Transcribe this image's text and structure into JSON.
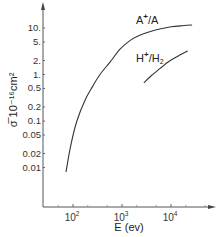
{
  "chart_data": {
    "type": "line",
    "title": "",
    "xlabel": "E (ev)",
    "ylabel": "σ̅ 10⁻¹⁶cm²",
    "xscale": "log",
    "yscale": "log",
    "xlim": [
      20,
      100000
    ],
    "ylim": [
      0.0025,
      30
    ],
    "grid": false,
    "legend": "inline",
    "x_ticks": [
      {
        "value": 100,
        "label_base": "10",
        "label_exp": "2"
      },
      {
        "value": 1000,
        "label_base": "10",
        "label_exp": "3"
      },
      {
        "value": 10000,
        "label_base": "10",
        "label_exp": "4"
      }
    ],
    "x_minor_ticks": [
      50,
      200,
      500,
      2000,
      5000,
      20000,
      50000
    ],
    "y_ticks": [
      {
        "value": 10,
        "label": "10."
      },
      {
        "value": 5,
        "label": "5."
      },
      {
        "value": 2,
        "label": "2."
      },
      {
        "value": 1,
        "label": "1."
      },
      {
        "value": 0.5,
        "label": "0.5"
      },
      {
        "value": 0.2,
        "label": "0.2"
      },
      {
        "value": 0.1,
        "label": "0.1"
      },
      {
        "value": 0.05,
        "label": "0.05"
      },
      {
        "value": 0.02,
        "label": "0.02"
      },
      {
        "value": 0.01,
        "label": "0.01"
      }
    ],
    "series": [
      {
        "name": "A+/A",
        "label_main": "A",
        "label_sup": "+",
        "label_rest": "/A",
        "x": [
          72,
          90,
          120,
          176,
          250,
          355,
          570,
          910,
          1500,
          2300,
          3800,
          5900,
          10000,
          17000,
          27000
        ],
        "y": [
          0.008,
          0.03,
          0.1,
          0.28,
          0.55,
          1.0,
          1.85,
          3.5,
          5.5,
          7.0,
          8.4,
          9.5,
          10.6,
          11.2,
          11.6
        ]
      },
      {
        "name": "H+/H2",
        "label_main": "H",
        "label_sup": "+",
        "label_rest": "/H",
        "label_sub": "2",
        "x": [
          2800,
          4000,
          6000,
          9000,
          14000,
          22000
        ],
        "y": [
          0.66,
          0.95,
          1.35,
          1.9,
          2.5,
          3.2
        ]
      }
    ]
  }
}
